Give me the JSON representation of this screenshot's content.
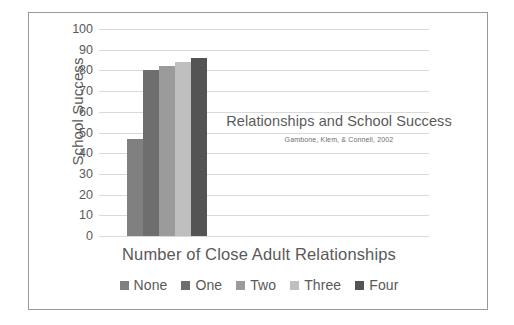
{
  "chart_data": {
    "type": "bar",
    "title": "Relationships and School Success",
    "citation": "Gambone, Klem, & Connell, 2002",
    "xlabel": "Number of Close Adult Relationships",
    "ylabel": "School Success",
    "categories": [
      "None",
      "One",
      "Two",
      "Three",
      "Four"
    ],
    "values": [
      47,
      80,
      82,
      84,
      86
    ],
    "series": [
      {
        "name": "School Success",
        "values": [
          47,
          80,
          82,
          84,
          86
        ]
      }
    ],
    "ylim": [
      0,
      100
    ],
    "ytick_labels": [
      "100",
      "90",
      "80",
      "70",
      "60",
      "50",
      "40",
      "30",
      "20",
      "10",
      "0"
    ],
    "ytick_values": [
      100,
      90,
      80,
      70,
      60,
      50,
      40,
      30,
      20,
      10,
      0
    ],
    "grid": true,
    "legend_position": "bottom",
    "bar_colors": [
      "#808080",
      "#6e6e6e",
      "#9b9b9b",
      "#bfbfbf",
      "#545454"
    ],
    "gridline_color": "#d9d9d9",
    "text_color": "#595959"
  },
  "legend": {
    "items": [
      {
        "label": "None",
        "color": "#808080"
      },
      {
        "label": "One",
        "color": "#6e6e6e"
      },
      {
        "label": "Two",
        "color": "#9b9b9b"
      },
      {
        "label": "Three",
        "color": "#bfbfbf"
      },
      {
        "label": "Four",
        "color": "#545454"
      }
    ]
  }
}
